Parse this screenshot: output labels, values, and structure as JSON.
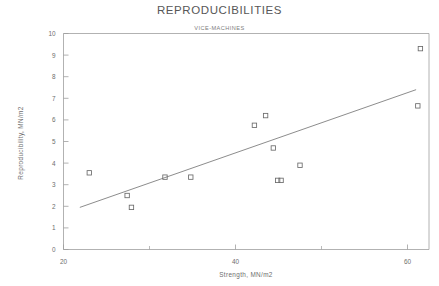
{
  "chart_data": {
    "type": "scatter",
    "title": "REPRODUCIBILITIES",
    "subtitle": "VICE-MACHINES",
    "xlabel": "Strength, MN/m2",
    "ylabel": "Reproducibility, MN/m2",
    "xlim": [
      20,
      62.5
    ],
    "ylim": [
      0,
      10
    ],
    "xticks": [
      20,
      40,
      60
    ],
    "xticks_minor": [
      30,
      50
    ],
    "yticks": [
      0,
      1,
      2,
      3,
      4,
      5,
      6,
      7,
      8,
      9,
      10
    ],
    "xtick_labels": [
      "20",
      "40",
      "60"
    ],
    "ytick_labels": [
      "0",
      "1",
      "2",
      "3",
      "4",
      "5",
      "6",
      "7",
      "8",
      "9",
      "10"
    ],
    "grid": false,
    "legend": "none",
    "marker": "open-square",
    "points": [
      {
        "x": 23.0,
        "y": 3.55
      },
      {
        "x": 27.4,
        "y": 2.5
      },
      {
        "x": 27.9,
        "y": 1.95
      },
      {
        "x": 31.8,
        "y": 3.35
      },
      {
        "x": 34.8,
        "y": 3.35
      },
      {
        "x": 42.2,
        "y": 5.75
      },
      {
        "x": 43.5,
        "y": 6.2
      },
      {
        "x": 44.4,
        "y": 4.7
      },
      {
        "x": 44.9,
        "y": 3.2
      },
      {
        "x": 45.3,
        "y": 3.2
      },
      {
        "x": 47.5,
        "y": 3.9
      },
      {
        "x": 61.2,
        "y": 6.65
      },
      {
        "x": 61.5,
        "y": 9.3
      }
    ],
    "fit_line": {
      "label": "regression-line",
      "x_start": 21.9,
      "y_start": 1.95,
      "x_end": 61.0,
      "y_end": 7.4
    }
  },
  "axes": {
    "y_axis_title": "Reproducibility, MN/m2",
    "x_axis_title": "Strength, MN/m2"
  },
  "header": {
    "title": "REPRODUCIBILITIES",
    "subtitle": "VICE-MACHINES"
  }
}
